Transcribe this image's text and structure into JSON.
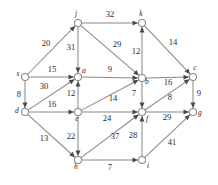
{
  "figure": {
    "type": "directed-weighted-graph",
    "background_color": "#ffffff",
    "node_fill_color": "#ffffff",
    "node_stroke_color": "#8a8a8a",
    "edge_color": "#8a8a8a",
    "arrow_color": "#4a4a4a",
    "label_color": "#2b2b2b"
  },
  "nodes": [
    {
      "id": "s",
      "label": "s",
      "x": 25,
      "y": 77,
      "label_dx": -7,
      "label_dy": -1
    },
    {
      "id": "j",
      "label": "j",
      "x": 78,
      "y": 23,
      "label_dx": -2,
      "label_dy": -7
    },
    {
      "id": "k",
      "label": "k",
      "x": 142,
      "y": 23,
      "label_dx": -1,
      "label_dy": -7
    },
    {
      "id": "a",
      "label": "a",
      "x": 78,
      "y": 77,
      "label_dx": 6,
      "label_dy": -4
    },
    {
      "id": "b",
      "label": "b",
      "x": 142,
      "y": 78,
      "label_dx": 5,
      "label_dy": 6
    },
    {
      "id": "c",
      "label": "c",
      "x": 193,
      "y": 77,
      "label_dx": 2,
      "label_dy": -7
    },
    {
      "id": "d",
      "label": "d",
      "x": 25,
      "y": 112,
      "label_dx": -8,
      "label_dy": 1
    },
    {
      "id": "e",
      "label": "e",
      "x": 78,
      "y": 112,
      "label_dx": -1,
      "label_dy": 9
    },
    {
      "id": "f",
      "label": "f",
      "x": 142,
      "y": 112,
      "label_dx": 5,
      "label_dy": 9
    },
    {
      "id": "g",
      "label": "g",
      "x": 193,
      "y": 112,
      "label_dx": 7,
      "label_dy": 3
    },
    {
      "id": "h",
      "label": "h",
      "x": 78,
      "y": 160,
      "label_dx": -2,
      "label_dy": 9
    },
    {
      "id": "i",
      "label": "i",
      "x": 142,
      "y": 160,
      "label_dx": 6,
      "label_dy": 8
    }
  ],
  "edges": [
    {
      "from": "s",
      "to": "j",
      "weight": "20",
      "lx": 46,
      "ly": 46
    },
    {
      "from": "s",
      "to": "a",
      "weight": "15",
      "lx": 52,
      "ly": 72
    },
    {
      "from": "s",
      "to": "d",
      "weight": "8",
      "lx": 19,
      "ly": 97
    },
    {
      "from": "j",
      "to": "k",
      "weight": "32",
      "lx": 110,
      "ly": 17
    },
    {
      "from": "j",
      "to": "a",
      "weight": "31",
      "lx": 71,
      "ly": 50
    },
    {
      "from": "j",
      "to": "b",
      "weight": "29",
      "lx": 117,
      "ly": 47
    },
    {
      "from": "k",
      "to": "c",
      "weight": "14",
      "lx": 173,
      "ly": 45
    },
    {
      "from": "b",
      "to": "k",
      "weight": "12",
      "lx": 136,
      "ly": 54
    },
    {
      "from": "a",
      "to": "b",
      "weight": "9",
      "lx": 110,
      "ly": 72
    },
    {
      "from": "b",
      "to": "c",
      "weight": "16",
      "lx": 168,
      "ly": 85
    },
    {
      "from": "b",
      "to": "f",
      "weight": "7",
      "lx": 134,
      "ly": 96
    },
    {
      "from": "c",
      "to": "g",
      "weight": "9",
      "lx": 199,
      "ly": 96
    },
    {
      "from": "d",
      "to": "a",
      "weight": "30",
      "lx": 44,
      "ly": 89
    },
    {
      "from": "d",
      "to": "e",
      "weight": "16",
      "lx": 52,
      "ly": 107
    },
    {
      "from": "d",
      "to": "h",
      "weight": "13",
      "lx": 44,
      "ly": 141
    },
    {
      "from": "e",
      "to": "a",
      "weight": "12",
      "lx": 71,
      "ly": 96
    },
    {
      "from": "e",
      "to": "b",
      "weight": "14",
      "lx": 113,
      "ly": 101
    },
    {
      "from": "e",
      "to": "f",
      "weight": "24",
      "lx": 107,
      "ly": 121
    },
    {
      "from": "e",
      "to": "h",
      "weight": "22",
      "lx": 71,
      "ly": 139
    },
    {
      "from": "f",
      "to": "c",
      "weight": "8",
      "lx": 170,
      "ly": 100
    },
    {
      "from": "f",
      "to": "g",
      "weight": "29",
      "lx": 167,
      "ly": 120
    },
    {
      "from": "h",
      "to": "f",
      "weight": "37",
      "lx": 115,
      "ly": 139
    },
    {
      "from": "h",
      "to": "i",
      "weight": "7",
      "lx": 110,
      "ly": 170
    },
    {
      "from": "i",
      "to": "f",
      "weight": "28",
      "lx": 133,
      "ly": 138
    },
    {
      "from": "i",
      "to": "g",
      "weight": "41",
      "lx": 172,
      "ly": 145
    }
  ]
}
